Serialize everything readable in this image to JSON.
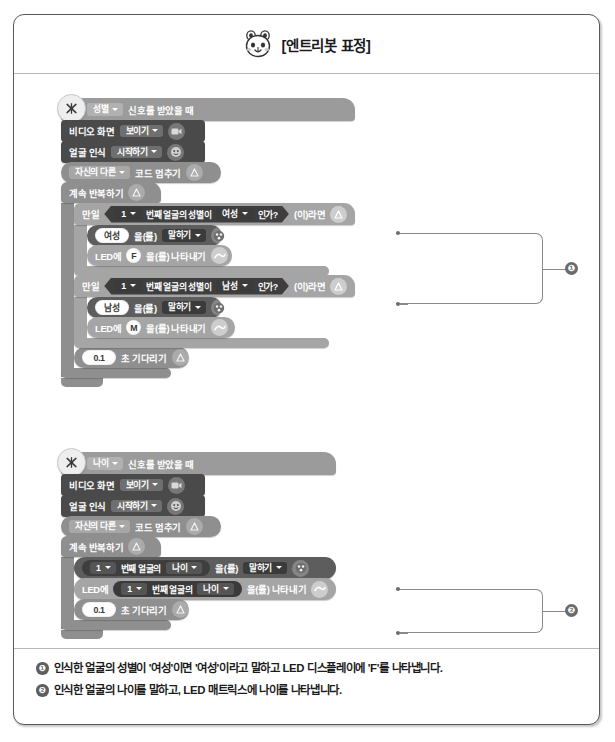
{
  "header": {
    "logo_icon": "entrybot-face-icon",
    "title": "[엔트리봇 표정]"
  },
  "scripts": [
    {
      "id": "gender-script",
      "hat": {
        "icon": "signal-receive-icon",
        "dropdown": "성별",
        "label": "신호를 받았을 때"
      },
      "blocks": [
        {
          "type": "video-show",
          "label": "비디오 화면",
          "dropdown": "보이기",
          "icon": "video-camera-icon"
        },
        {
          "type": "face-recognition",
          "label": "얼굴 인식",
          "dropdown": "시작하기",
          "icon": "face-icon"
        },
        {
          "type": "stop-code",
          "dropdown": "자신의 다른",
          "label": "코드 멈추기",
          "icon": "flow-icon"
        }
      ],
      "repeat": {
        "label": "계속 반복하기",
        "icon": "flow-icon",
        "children": [
          {
            "type": "if",
            "prefix": "만일",
            "suffix": "(이)라면",
            "icon": "flow-icon",
            "condition": {
              "index": "1",
              "mid": "번째 얼굴의 성별이",
              "value": "여성",
              "tail": "인가?"
            },
            "body": [
              {
                "type": "say",
                "value": "여성",
                "connector": "을(를)",
                "dropdown": "말하기",
                "icon": "entrybot-icon"
              },
              {
                "type": "led-display",
                "prefix": "LED에",
                "value": "F",
                "suffix": "을(를) 나타내기",
                "icon": "led-icon"
              }
            ]
          },
          {
            "type": "if",
            "prefix": "만일",
            "suffix": "(이)라면",
            "icon": "flow-icon",
            "condition": {
              "index": "1",
              "mid": "번째 얼굴의 성별이",
              "value": "남성",
              "tail": "인가?"
            },
            "body": [
              {
                "type": "say",
                "value": "남성",
                "connector": "을(를)",
                "dropdown": "말하기",
                "icon": "entrybot-icon"
              },
              {
                "type": "led-display",
                "prefix": "LED에",
                "value": "M",
                "suffix": "을(를) 나타내기",
                "icon": "led-icon"
              }
            ]
          },
          {
            "type": "wait",
            "value": "0.1",
            "label": "초 기다리기",
            "icon": "flow-icon"
          }
        ]
      }
    },
    {
      "id": "age-script",
      "hat": {
        "icon": "signal-receive-icon",
        "dropdown": "나이",
        "label": "신호를 받았을 때"
      },
      "blocks": [
        {
          "type": "video-show",
          "label": "비디오 화면",
          "dropdown": "보이기",
          "icon": "video-camera-icon"
        },
        {
          "type": "face-recognition",
          "label": "얼굴 인식",
          "dropdown": "시작하기",
          "icon": "face-icon"
        },
        {
          "type": "stop-code",
          "dropdown": "자신의 다른",
          "label": "코드 멈추기",
          "icon": "flow-icon"
        }
      ],
      "repeat": {
        "label": "계속 반복하기",
        "icon": "flow-icon",
        "children": [
          {
            "type": "say-reporter",
            "reporter": {
              "index": "1",
              "mid": "번째 얼굴의",
              "value": "나이"
            },
            "connector": "을(를)",
            "dropdown": "말하기",
            "icon": "entrybot-icon"
          },
          {
            "type": "led-display-reporter",
            "prefix": "LED에",
            "reporter": {
              "index": "1",
              "mid": "번째 얼굴의",
              "value": "나이"
            },
            "suffix": "을(를) 나타내기",
            "icon": "led-icon"
          },
          {
            "type": "wait",
            "value": "0.1",
            "label": "초 기다리기",
            "icon": "flow-icon"
          }
        ]
      }
    }
  ],
  "callouts": [
    {
      "number": "❶"
    },
    {
      "number": "❷"
    }
  ],
  "captions": [
    {
      "number": "❶",
      "text": "인식한 얼굴의 성별이 '여성'이면 '여성'이라고 말하고 LED 디스플레이에 'F'를 나타냅니다."
    },
    {
      "number": "❷",
      "text": "인식한 얼굴의 나이를 말하고, LED 매트릭스에 나이를 나타냅니다."
    }
  ],
  "colors": {
    "frame_border": "#595959",
    "hat_block": "#9b9b9b",
    "dark_block": "#4a4a4a",
    "flow_block": "#8f8f8f",
    "light_block": "#a5a5a5",
    "annotation": "#8a8a8a"
  }
}
